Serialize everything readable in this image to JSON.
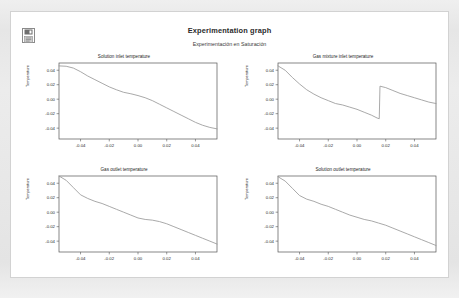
{
  "header": {
    "title": "Experimentation graph",
    "subtitle": "Experimentación en Saturación",
    "icon_name": "document-save-icon"
  },
  "colors": {
    "page_background": "#e8e8e8",
    "sheet_background": "#ffffff",
    "sheet_border": "#d2d2d2",
    "axis": "#555555",
    "curve": "#9a9a9a",
    "text": "#2b2b2b"
  },
  "chart_data": [
    {
      "id": "solution-inlet-temperature",
      "type": "line",
      "title": "Solution inlet temperature",
      "xlabel": "",
      "ylabel": "Temperature",
      "xlim": [
        -0.055,
        0.055
      ],
      "ylim": [
        -0.055,
        0.05
      ],
      "xticks": [
        -0.04,
        -0.02,
        0.0,
        0.02,
        0.04
      ],
      "xticklabels": [
        "-0.04",
        "-0.02",
        "0.00",
        "0.02",
        "0.04"
      ],
      "yticks": [
        0.04,
        0.02,
        0.0,
        -0.02,
        -0.04
      ],
      "yticklabels": [
        "0.04",
        "0.02",
        "0.00",
        "-0.02",
        "-0.04"
      ],
      "grid": false,
      "legend": "none",
      "x": [
        -0.055,
        -0.05,
        -0.045,
        -0.04,
        -0.035,
        -0.03,
        -0.025,
        -0.02,
        -0.015,
        -0.01,
        -0.005,
        0.0,
        0.005,
        0.01,
        0.015,
        0.02,
        0.025,
        0.03,
        0.035,
        0.04,
        0.045,
        0.05,
        0.055
      ],
      "y": [
        0.046,
        0.0455,
        0.043,
        0.038,
        0.032,
        0.027,
        0.022,
        0.017,
        0.013,
        0.0095,
        0.0075,
        0.005,
        0.002,
        -0.002,
        -0.007,
        -0.012,
        -0.017,
        -0.022,
        -0.027,
        -0.032,
        -0.036,
        -0.039,
        -0.041
      ]
    },
    {
      "id": "gas-mixture-inlet-temperature",
      "type": "line",
      "title": "Gas mixture inlet temperature",
      "xlabel": "",
      "ylabel": "Temperature",
      "xlim": [
        -0.055,
        0.055
      ],
      "ylim": [
        -0.055,
        0.05
      ],
      "xticks": [
        -0.04,
        -0.02,
        0.0,
        0.02,
        0.04
      ],
      "xticklabels": [
        "-0.04",
        "-0.02",
        "0.00",
        "0.02",
        "0.04"
      ],
      "yticks": [
        0.04,
        0.02,
        0.0,
        -0.02,
        -0.04
      ],
      "yticklabels": [
        "0.04",
        "0.02",
        "0.00",
        "-0.02",
        "-0.04"
      ],
      "grid": false,
      "legend": "none",
      "x": [
        -0.055,
        -0.05,
        -0.045,
        -0.04,
        -0.035,
        -0.03,
        -0.025,
        -0.02,
        -0.015,
        -0.01,
        -0.005,
        0.0,
        0.005,
        0.01,
        0.014,
        0.0155,
        0.016,
        0.02,
        0.025,
        0.03,
        0.035,
        0.04,
        0.045,
        0.05,
        0.055
      ],
      "y": [
        0.046,
        0.04,
        0.03,
        0.021,
        0.013,
        0.007,
        0.002,
        -0.002,
        -0.006,
        -0.008,
        -0.011,
        -0.014,
        -0.018,
        -0.022,
        -0.026,
        -0.027,
        0.018,
        0.016,
        0.012,
        0.008,
        0.005,
        0.002,
        -0.001,
        -0.004,
        -0.006
      ]
    },
    {
      "id": "gas-outlet-temperature",
      "type": "line",
      "title": "Gas outlet temperature",
      "xlabel": "",
      "ylabel": "Temperature",
      "xlim": [
        -0.055,
        0.055
      ],
      "ylim": [
        -0.055,
        0.05
      ],
      "xticks": [
        -0.04,
        -0.02,
        0.0,
        0.02,
        0.04
      ],
      "xticklabels": [
        "-0.04",
        "-0.02",
        "0.00",
        "0.02",
        "0.04"
      ],
      "yticks": [
        0.04,
        0.02,
        0.0,
        -0.02,
        -0.04
      ],
      "yticklabels": [
        "0.04",
        "0.02",
        "0.00",
        "-0.02",
        "-0.04"
      ],
      "grid": false,
      "legend": "none",
      "x": [
        -0.055,
        -0.05,
        -0.045,
        -0.04,
        -0.035,
        -0.03,
        -0.025,
        -0.02,
        -0.015,
        -0.01,
        -0.005,
        0.0,
        0.005,
        0.01,
        0.015,
        0.02,
        0.025,
        0.03,
        0.035,
        0.04,
        0.045,
        0.05,
        0.055
      ],
      "y": [
        0.05,
        0.044,
        0.034,
        0.024,
        0.019,
        0.015,
        0.012,
        0.008,
        0.004,
        0.0,
        -0.004,
        -0.008,
        -0.01,
        -0.011,
        -0.013,
        -0.016,
        -0.02,
        -0.024,
        -0.028,
        -0.032,
        -0.036,
        -0.04,
        -0.044
      ]
    },
    {
      "id": "solution-outlet-temperature",
      "type": "line",
      "title": "Solution outlet temperature",
      "xlabel": "",
      "ylabel": "Temperature",
      "xlim": [
        -0.055,
        0.055
      ],
      "ylim": [
        -0.055,
        0.05
      ],
      "xticks": [
        -0.04,
        -0.02,
        0.0,
        0.02,
        0.04
      ],
      "xticklabels": [
        "-0.04",
        "-0.02",
        "0.00",
        "0.02",
        "0.04"
      ],
      "yticks": [
        0.04,
        0.02,
        0.0,
        -0.02,
        -0.04
      ],
      "yticklabels": [
        "0.04",
        "0.02",
        "0.00",
        "-0.02",
        "-0.04"
      ],
      "grid": false,
      "legend": "none",
      "x": [
        -0.055,
        -0.05,
        -0.045,
        -0.04,
        -0.035,
        -0.03,
        -0.025,
        -0.02,
        -0.015,
        -0.01,
        -0.005,
        0.0,
        0.005,
        0.01,
        0.015,
        0.02,
        0.025,
        0.03,
        0.035,
        0.04,
        0.045,
        0.05,
        0.055
      ],
      "y": [
        0.049,
        0.043,
        0.033,
        0.023,
        0.018,
        0.015,
        0.011,
        0.008,
        0.004,
        0.0,
        -0.004,
        -0.007,
        -0.01,
        -0.012,
        -0.015,
        -0.018,
        -0.022,
        -0.026,
        -0.03,
        -0.034,
        -0.038,
        -0.042,
        -0.046
      ]
    }
  ]
}
